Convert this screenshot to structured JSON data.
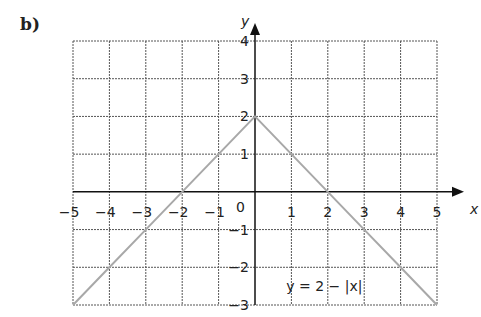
{
  "panel_label": "b)",
  "chart_data": {
    "type": "line",
    "title": "",
    "xlabel": "x",
    "ylabel": "y",
    "xlim": [
      -5,
      5
    ],
    "ylim": [
      -3,
      4
    ],
    "grid": true,
    "x_ticks": [
      "-5",
      "-4",
      "-3",
      "-2",
      "-1",
      "1",
      "2",
      "3",
      "4",
      "5"
    ],
    "y_ticks": [
      "4",
      "3",
      "2",
      "1",
      "-1",
      "-2",
      "-3"
    ],
    "origin_label": "0",
    "series": [
      {
        "name": "y = 2 - |x|",
        "color": "#a8a8a8",
        "x": [
          -5,
          -4,
          -3,
          -2,
          -1,
          0,
          1,
          2,
          3,
          4,
          5
        ],
        "y": [
          -3,
          -2,
          -1,
          0,
          1,
          2,
          1,
          0,
          -1,
          -2,
          -3
        ]
      }
    ],
    "annotations": [
      {
        "text": "y = 2 − |x|",
        "x": 1.6,
        "y": -2.5
      }
    ]
  },
  "colors": {
    "grid": "#555555",
    "axis": "#111111",
    "curve": "#a8a8a8"
  }
}
